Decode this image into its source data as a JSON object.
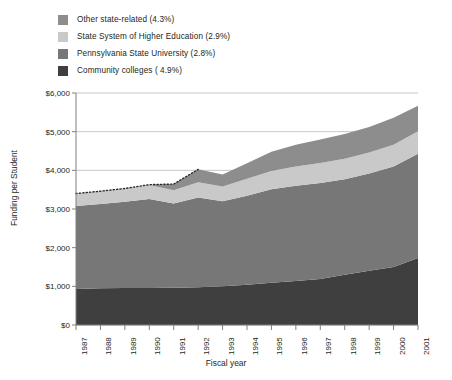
{
  "legend": {
    "items": [
      {
        "label": "Other state-related (4.3%)",
        "color": "#8d8d8d",
        "key": "other_state_related"
      },
      {
        "label": "State System of Higher Education (2.9%)",
        "color": "#c9c9c9",
        "key": "state_system"
      },
      {
        "label": "Pennsylvania State University (2.8%)",
        "color": "#777777",
        "key": "penn_state"
      },
      {
        "label": "Community colleges ( 4.9%)",
        "color": "#3f3f3f",
        "key": "community_colleges"
      }
    ]
  },
  "axes": {
    "y_title": "Funding per Student",
    "x_title": "Fiscal year",
    "y_ticks": [
      "$0",
      "$1,000",
      "$2,000",
      "$3,000",
      "$4,000",
      "$5,000",
      "$6,000"
    ],
    "x_ticks": [
      "1987",
      "1988",
      "1989",
      "1990",
      "1991",
      "1992",
      "1993",
      "1994",
      "1995",
      "1996",
      "1997",
      "1998",
      "1999",
      "2000",
      "2001"
    ]
  },
  "chart_data": {
    "type": "area",
    "title": "",
    "subtitle": "",
    "xlabel": "Fiscal year",
    "ylabel": "Funding per Student",
    "ylim": [
      0,
      6000
    ],
    "ytick_step": 1000,
    "grid": true,
    "legend_position": "top-left",
    "stacked": true,
    "categories": [
      "1987",
      "1988",
      "1989",
      "1990",
      "1991",
      "1992",
      "1993",
      "1994",
      "1995",
      "1996",
      "1997",
      "1998",
      "1999",
      "2000",
      "2001"
    ],
    "series": [
      {
        "name": "Community colleges ( 4.9%)",
        "color": "#3f3f3f",
        "values": [
          930,
          950,
          960,
          960,
          965,
          975,
          1000,
          1040,
          1090,
          1140,
          1190,
          1300,
          1400,
          1500,
          1730
        ]
      },
      {
        "name": "Pennsylvania State University (2.8%)",
        "color": "#777777",
        "values": [
          2150,
          2180,
          2230,
          2300,
          2180,
          2320,
          2200,
          2300,
          2420,
          2460,
          2480,
          2470,
          2520,
          2600,
          2700
        ]
      },
      {
        "name": "State System of Higher Education (2.9%)",
        "color": "#c9c9c9",
        "values": [
          320,
          330,
          340,
          360,
          340,
          400,
          380,
          440,
          470,
          500,
          520,
          530,
          540,
          560,
          580
        ]
      },
      {
        "name": "Other state-related (4.3%)",
        "color": "#8d8d8d",
        "values": [
          0,
          0,
          0,
          10,
          160,
          330,
          310,
          400,
          500,
          560,
          610,
          640,
          660,
          700,
          660
        ]
      }
    ],
    "stack_totals": [
      3400,
      3460,
      3530,
      3630,
      3645,
      4025,
      3890,
      4180,
      4480,
      4660,
      4800,
      4940,
      5120,
      5360,
      5670
    ],
    "annotation": {
      "name": "dotted-top-line",
      "style": "dotted",
      "description": "Dotted line marking top of stack for early fiscal years",
      "x_range": [
        "1987",
        "1992"
      ]
    }
  },
  "colors": {
    "background": "#ffffff",
    "grid": "#b9b9b9",
    "axis": "#808080",
    "text": "#231f20"
  }
}
